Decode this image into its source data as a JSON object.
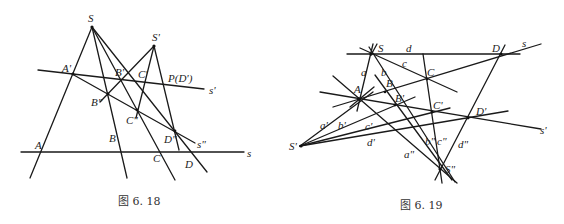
{
  "figures": [
    {
      "caption": "图 6. 18",
      "labels": {
        "S": "S",
        "S_prime": "S'",
        "A_prime": "A'",
        "B_prime": "B'",
        "C_prime": "C'",
        "P_D_prime": "P(D')",
        "s_prime": "s'",
        "B_dbl": "B\"",
        "C_dbl": "C\"",
        "D_dbl": "D\"",
        "s_dbl": "s\"",
        "A": "A",
        "B": "B",
        "C": "C",
        "D": "D",
        "s": "s"
      }
    },
    {
      "caption": "图 6. 19",
      "labels": {
        "S": "S",
        "d": "d",
        "D": "D",
        "s": "s",
        "a": "a",
        "b": "b",
        "c": "c",
        "C": "C",
        "A": "A",
        "B": "B",
        "B_prime": "B'",
        "C_prime": "C'",
        "D_prime": "D'",
        "s_prime": "s'",
        "a_prime": "a'",
        "b_prime": "b'",
        "c_prime": "c'",
        "d_prime": "d'",
        "S_prime": "S'",
        "a_dbl": "a\"",
        "b_dbl": "b\"",
        "c_dbl": "c\"",
        "d_dbl": "d\"",
        "S_dbl": "S\""
      }
    }
  ]
}
